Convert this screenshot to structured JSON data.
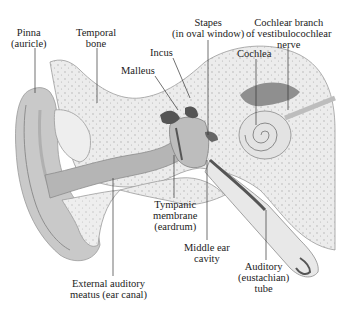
{
  "figure": {
    "colors": {
      "background": "#ffffff",
      "bone_fill": "#ececec",
      "bone_dots": "#9a9a9a",
      "soft_tissue": "#c9c9c9",
      "canal": "#b5b5b5",
      "dark_structures": "#555555",
      "leader_lines": "#333333",
      "text": "#222222"
    }
  },
  "labels": [
    {
      "id": "pinna",
      "lines": [
        "Pinna",
        "(auricle)"
      ]
    },
    {
      "id": "temporal-bone",
      "lines": [
        "Temporal",
        "bone"
      ]
    },
    {
      "id": "incus",
      "lines": [
        "Incus"
      ]
    },
    {
      "id": "malleus",
      "lines": [
        "Malleus"
      ]
    },
    {
      "id": "stapes",
      "lines": [
        "Stapes",
        "(in oval window)"
      ]
    },
    {
      "id": "cochlear-nerve",
      "lines": [
        "Cochlear branch",
        "of vestibulocochlear",
        "nerve"
      ]
    },
    {
      "id": "cochlea",
      "lines": [
        "Cochlea"
      ]
    },
    {
      "id": "tympanic-membrane",
      "lines": [
        "Tympanic",
        "membrane",
        "(eardrum)"
      ]
    },
    {
      "id": "middle-ear-cavity",
      "lines": [
        "Middle ear",
        "cavity"
      ]
    },
    {
      "id": "auditory-tube",
      "lines": [
        "Auditory",
        "(eustachian)",
        "tube"
      ]
    },
    {
      "id": "external-auditory-meatus",
      "lines": [
        "External auditory",
        "meatus (ear canal)"
      ]
    }
  ]
}
